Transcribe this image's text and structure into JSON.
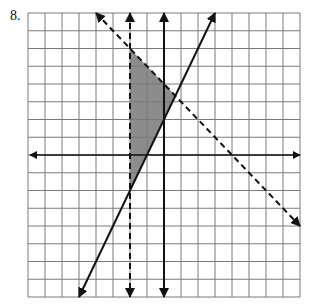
{
  "problem": {
    "number_label": "8."
  },
  "graph": {
    "grid": {
      "x_min": -8,
      "x_max": 8,
      "y_min": -8,
      "y_max": 8,
      "origin_px": [
        164,
        155
      ],
      "unit_px": [
        17,
        17.75
      ],
      "grid_color": "#7a7a7a",
      "axis_color": "#111111"
    },
    "shade_color": "#8c8c8c",
    "lines": [
      {
        "name": "dashed-vertical-line",
        "equation": "x = -2",
        "style": "dashed",
        "from": [
          -2,
          8
        ],
        "to": [
          -2,
          -8
        ],
        "arrows": "both"
      },
      {
        "name": "solid-vertical-line",
        "equation": "x = 0",
        "style": "solid",
        "from": [
          0,
          8
        ],
        "to": [
          0,
          -8
        ],
        "arrows": "both"
      },
      {
        "name": "solid-slanted-line",
        "equation": "y = 2x + 2",
        "style": "solid",
        "from": [
          -5,
          -8
        ],
        "to": [
          3,
          8
        ],
        "arrows": "both"
      },
      {
        "name": "dashed-slanted-line",
        "equation": "y = -x + 4",
        "style": "dashed",
        "from": [
          -4,
          8
        ],
        "to": [
          8,
          -4
        ],
        "arrows": "both"
      }
    ],
    "shaded_region": {
      "vertices": [
        [
          -2,
          6
        ],
        [
          0.667,
          3.333
        ],
        [
          -2,
          -2
        ]
      ]
    }
  }
}
